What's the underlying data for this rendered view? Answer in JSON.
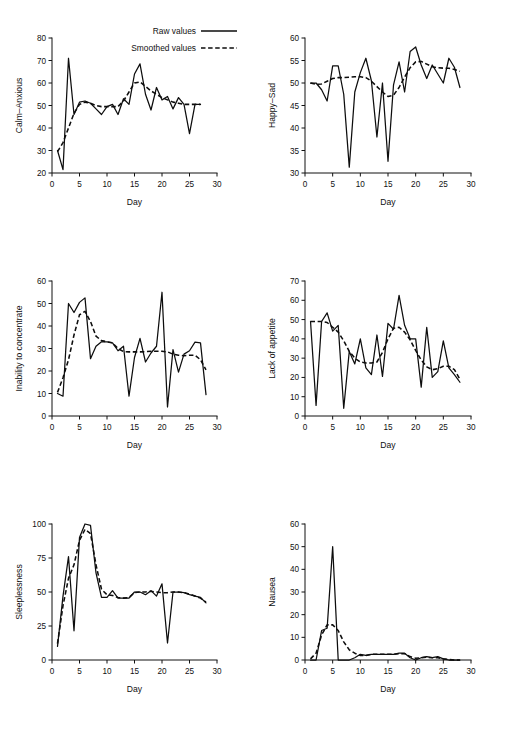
{
  "figure": {
    "background": "#ffffff",
    "ink_color": "#0d0d0d",
    "rows": 3,
    "cols": 2
  },
  "legend": {
    "position": "top-right of first panel",
    "entries": [
      {
        "label": "Raw values",
        "style": "solid"
      },
      {
        "label": "Smoothed values",
        "style": "dashed"
      }
    ]
  },
  "chart_data": [
    {
      "type": "line",
      "panel": 1,
      "title": "",
      "xlabel": "Day",
      "ylabel": "Calm–Anxious",
      "xlim": [
        0,
        30
      ],
      "ylim": [
        20,
        80
      ],
      "xticks": [
        0,
        5,
        10,
        15,
        20,
        25,
        30
      ],
      "yticks": [
        20,
        30,
        40,
        50,
        60,
        70,
        80
      ],
      "grid": false,
      "x": [
        1,
        2,
        3,
        4,
        5,
        6,
        7,
        8,
        9,
        10,
        11,
        12,
        13,
        14,
        15,
        16,
        17,
        18,
        19,
        20,
        21,
        22,
        23,
        24,
        25,
        26,
        27
      ],
      "series": [
        {
          "name": "Raw values",
          "style": "solid",
          "values": [
            30,
            21.5,
            71,
            46,
            51.5,
            52,
            51,
            48.5,
            46,
            49.5,
            50.5,
            46,
            53,
            50.5,
            64,
            68.5,
            55,
            48,
            58,
            52.5,
            54,
            48.5,
            53.5,
            50.5,
            37.5,
            50.5,
            50.5
          ]
        },
        {
          "name": "Smoothed values",
          "style": "dashed",
          "values": [
            29.5,
            33.5,
            40,
            46.5,
            50.5,
            51.5,
            51,
            50,
            49.5,
            49.5,
            49.5,
            49.5,
            52,
            56,
            60,
            60.5,
            58.5,
            56.5,
            55,
            53.5,
            52.5,
            51.5,
            51,
            50.5,
            50.5,
            50.5,
            50.5
          ]
        }
      ]
    },
    {
      "type": "line",
      "panel": 2,
      "title": "",
      "xlabel": "Day",
      "ylabel": "Happy–Sad",
      "xlim": [
        0,
        30
      ],
      "ylim": [
        30,
        60
      ],
      "xticks": [
        0,
        5,
        10,
        15,
        20,
        25,
        30
      ],
      "yticks": [
        30,
        35,
        40,
        45,
        50,
        55,
        60
      ],
      "grid": false,
      "x": [
        1,
        2,
        3,
        4,
        5,
        6,
        7,
        8,
        9,
        10,
        11,
        12,
        13,
        14,
        15,
        16,
        17,
        18,
        19,
        20,
        21,
        22,
        23,
        24,
        25,
        26,
        27,
        28
      ],
      "series": [
        {
          "name": "Raw values",
          "style": "solid",
          "values": [
            50,
            50,
            48.5,
            46,
            53.8,
            53.8,
            47.5,
            31.3,
            48,
            52.3,
            55.5,
            50.5,
            38,
            50,
            32.6,
            49.6,
            54.7,
            48,
            57,
            58,
            54,
            51,
            54,
            52,
            50,
            55.5,
            53.5,
            49
          ]
        },
        {
          "name": "Smoothed values",
          "style": "dashed",
          "values": [
            50,
            49.7,
            49.8,
            50.4,
            51,
            51.2,
            51.2,
            51.3,
            51.4,
            51.4,
            51.2,
            50.4,
            49.2,
            48,
            47,
            47.3,
            49,
            51.3,
            53.4,
            54.7,
            54.8,
            54.2,
            53.6,
            53.4,
            53.3,
            53.3,
            53,
            52.6
          ]
        }
      ]
    },
    {
      "type": "line",
      "panel": 3,
      "title": "",
      "xlabel": "Day",
      "ylabel": "Inability to concentrate",
      "xlim": [
        0,
        30
      ],
      "ylim": [
        0,
        60
      ],
      "xticks": [
        0,
        5,
        10,
        15,
        20,
        25,
        30
      ],
      "yticks": [
        0,
        10,
        20,
        30,
        40,
        50,
        60
      ],
      "grid": false,
      "x": [
        1,
        2,
        3,
        4,
        5,
        6,
        7,
        8,
        9,
        10,
        11,
        12,
        13,
        14,
        15,
        16,
        17,
        18,
        19,
        20,
        21,
        22,
        23,
        24,
        25,
        26,
        27,
        28
      ],
      "series": [
        {
          "name": "Raw values",
          "style": "solid",
          "values": [
            10,
            8.8,
            50,
            46,
            50.5,
            52.5,
            25.5,
            31,
            33,
            33,
            32.5,
            29,
            31,
            8.8,
            26,
            34.5,
            24,
            28,
            31,
            55,
            4,
            29.5,
            19.5,
            27.5,
            29,
            32.8,
            32.5,
            9.5
          ]
        },
        {
          "name": "Smoothed values",
          "style": "dashed",
          "values": [
            10.5,
            17,
            25,
            36,
            45,
            46.5,
            42,
            35.5,
            33.5,
            33,
            32.5,
            30,
            28.6,
            28.5,
            28.5,
            28.5,
            28.6,
            28.8,
            28.8,
            28.8,
            28.5,
            27.5,
            27,
            26.8,
            27,
            27,
            25,
            20.5
          ]
        }
      ]
    },
    {
      "type": "line",
      "panel": 4,
      "title": "",
      "xlabel": "Day",
      "ylabel": "Lack of appetite",
      "xlim": [
        0,
        30
      ],
      "ylim": [
        0,
        70
      ],
      "xticks": [
        0,
        5,
        10,
        15,
        20,
        25,
        30
      ],
      "yticks": [
        0,
        10,
        20,
        30,
        40,
        50,
        60,
        70
      ],
      "grid": false,
      "x": [
        1,
        2,
        3,
        4,
        5,
        6,
        7,
        8,
        9,
        10,
        11,
        12,
        13,
        14,
        15,
        16,
        17,
        18,
        19,
        20,
        21,
        22,
        23,
        24,
        25,
        26,
        27,
        28
      ],
      "series": [
        {
          "name": "Raw values",
          "style": "solid",
          "values": [
            49,
            5.5,
            49,
            53.5,
            44,
            47,
            4,
            33.5,
            27,
            40,
            25,
            21.5,
            42,
            20.5,
            48,
            45,
            62.5,
            47,
            40,
            40,
            15,
            46,
            20,
            23,
            39,
            25,
            21.5,
            17.5
          ]
        },
        {
          "name": "Smoothed values",
          "style": "dashed",
          "values": [
            49,
            49,
            49,
            48.5,
            46,
            43.5,
            39,
            33.5,
            30,
            28,
            27.5,
            27.5,
            28,
            33,
            40,
            45.5,
            46,
            43.5,
            39.5,
            34,
            29,
            25.5,
            24,
            24.5,
            25.8,
            25.8,
            24,
            19
          ]
        }
      ]
    },
    {
      "type": "line",
      "panel": 5,
      "title": "",
      "xlabel": "Day",
      "ylabel": "Sleeplessness",
      "xlim": [
        0,
        30
      ],
      "ylim": [
        0,
        100
      ],
      "xticks": [
        0,
        5,
        10,
        15,
        20,
        25,
        30
      ],
      "yticks": [
        0,
        25,
        50,
        75,
        100
      ],
      "grid": false,
      "x": [
        1,
        2,
        3,
        4,
        5,
        6,
        7,
        8,
        9,
        10,
        11,
        12,
        13,
        14,
        15,
        16,
        17,
        18,
        19,
        20,
        21,
        22,
        23,
        24,
        25,
        26,
        27,
        28
      ],
      "series": [
        {
          "name": "Raw values",
          "style": "solid",
          "values": [
            10,
            47,
            76,
            21.5,
            90,
            100,
            99,
            64,
            46,
            46,
            51,
            45.5,
            45.5,
            45.5,
            50,
            50,
            48,
            51,
            47,
            56,
            12.5,
            50,
            50,
            49.5,
            48,
            47,
            46,
            42
          ]
        },
        {
          "name": "Smoothed values",
          "style": "dashed",
          "values": [
            12,
            40,
            60,
            70,
            88,
            96,
            93,
            70,
            52,
            48,
            47.5,
            46,
            45.5,
            46,
            49.5,
            50,
            50,
            50.5,
            50,
            49.5,
            49.5,
            50,
            50,
            49.5,
            48.5,
            47,
            45.5,
            42.5
          ]
        }
      ]
    },
    {
      "type": "line",
      "panel": 6,
      "title": "",
      "xlabel": "Day",
      "ylabel": "Nausea",
      "xlim": [
        0,
        30
      ],
      "ylim": [
        0,
        60
      ],
      "xticks": [
        0,
        5,
        10,
        15,
        20,
        25,
        30
      ],
      "yticks": [
        0,
        10,
        20,
        30,
        40,
        50,
        60
      ],
      "grid": false,
      "x": [
        1,
        2,
        3,
        4,
        5,
        6,
        7,
        8,
        9,
        10,
        11,
        12,
        13,
        14,
        15,
        16,
        17,
        18,
        19,
        20,
        21,
        22,
        23,
        24,
        25,
        26,
        27,
        28
      ],
      "series": [
        {
          "name": "Raw values",
          "style": "solid",
          "values": [
            0,
            0,
            13,
            14,
            50,
            0,
            0,
            0,
            1,
            2.5,
            2,
            2.5,
            2.5,
            2.5,
            2.5,
            2.5,
            3,
            3,
            1,
            0,
            1,
            1.5,
            1,
            1.5,
            0.5,
            0,
            0,
            0
          ]
        },
        {
          "name": "Smoothed values",
          "style": "dashed",
          "values": [
            0.5,
            3,
            11,
            15.5,
            15.5,
            13,
            8,
            4.5,
            3,
            2,
            2,
            2.5,
            2.5,
            2.5,
            2.5,
            2.5,
            2.8,
            2.8,
            1.5,
            0.8,
            1,
            1.2,
            1,
            1,
            0.5,
            0.2,
            0,
            0
          ]
        }
      ]
    }
  ]
}
